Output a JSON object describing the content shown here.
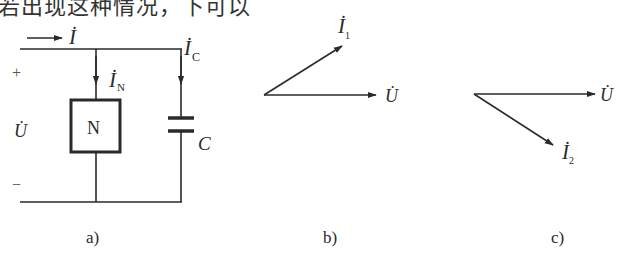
{
  "top_text": "若出现这种情况，下可以",
  "figure_a": {
    "caption": "a)",
    "labels": {
      "current_total": "İ",
      "current_N": "İ",
      "current_N_sub": "N",
      "current_C": "İ",
      "current_C_sub": "C",
      "plus": "+",
      "minus": "−",
      "voltage": "U̇",
      "network": "N",
      "capacitor": "C"
    }
  },
  "figure_b": {
    "caption": "b)",
    "labels": {
      "current": "İ",
      "current_sub": "1",
      "voltage": "U̇"
    },
    "description": "phasor İ1 leads U̇ by ~30°"
  },
  "figure_c": {
    "caption": "c)",
    "labels": {
      "current": "İ",
      "current_sub": "2",
      "voltage": "U̇"
    },
    "description": "phasor İ2 lags U̇ by ~33°"
  },
  "colors": {
    "line": "#2a2a2a",
    "background": "#ffffff"
  }
}
